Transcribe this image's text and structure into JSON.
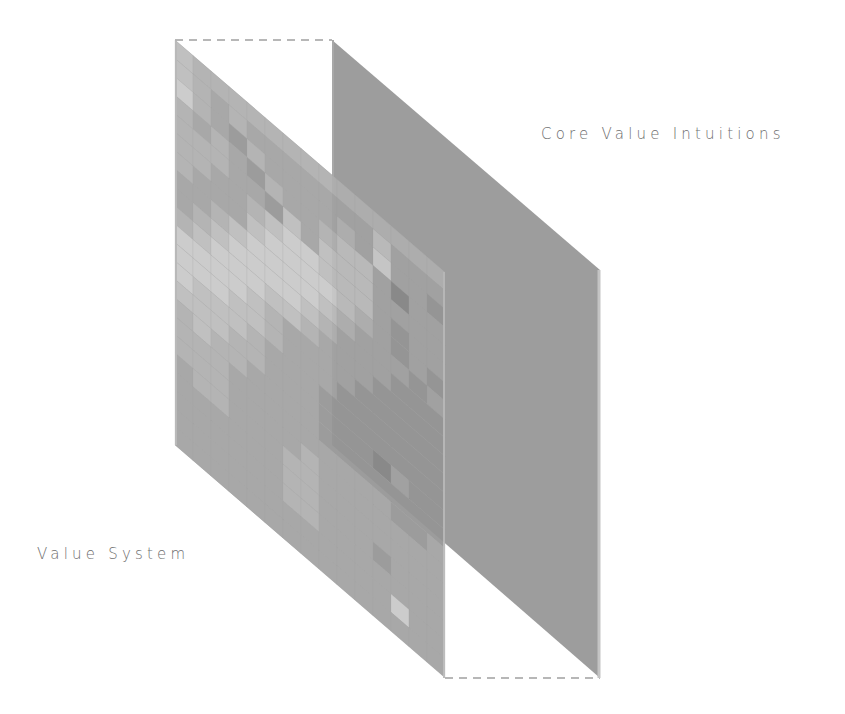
{
  "diagram": {
    "type": "layered-panels",
    "labels": {
      "back_panel": "Core Value Intuitions",
      "front_panel": "Value System"
    },
    "colors": {
      "background": "#ffffff",
      "back_panel_fill": "#9d9d9d",
      "back_panel_edge": "#c4c4c4",
      "front_panel_base": "#a8a8a8",
      "dashed_connector": "#a0a0a0",
      "label_text": "#6e6e6e"
    },
    "geometry": {
      "front_panel": {
        "x": 175,
        "y": 40,
        "width": 270,
        "height": 405,
        "shear": 0.86
      },
      "back_panel": {
        "x": 332,
        "y": 40,
        "width": 268,
        "height": 405,
        "shear": 0.86
      }
    },
    "grid": {
      "columns": 15,
      "rows": 22,
      "description": "Front panel is a heatmap-like grid of grayscale tiles (0 = dark, 9 = light)",
      "cells": [
        "6555555555555555",
        "6545444444464445",
        "7543544445474435",
        "5454354456642444",
        "5554436466644444",
        "5544567766643444",
        "5444677776543434",
        "4456777765444343",
        "4567777654443334",
        "5677766544433333",
        "7777654444333333",
        "7776654443333333",
        "7666544433333334",
        "6665544433324334",
        "5655444433333334",
        "5554444444443344",
        "5554444544444444",
        "4554445544444444",
        "4444445544434444",
        "4444445544444444",
        "4444444444447444",
        "4444444444444444"
      ]
    }
  }
}
